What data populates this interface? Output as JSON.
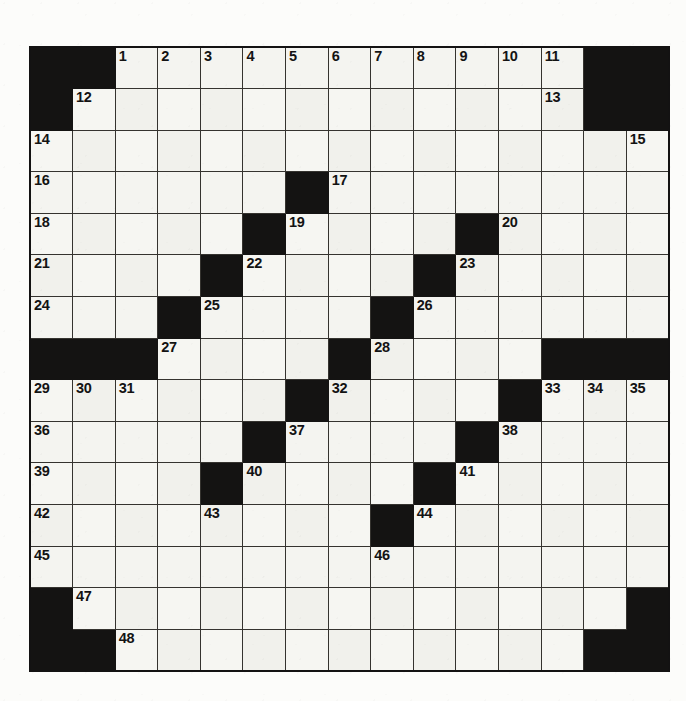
{
  "puzzle": {
    "title": "Crossword Grid",
    "type": "crossword-grid",
    "rows": 15,
    "cols": 15,
    "colors": {
      "block": "#141312",
      "cell": "#f4f4f0",
      "gridline": "#35332f",
      "border": "#131212",
      "number": "#131313",
      "paper": "#fcfcfa"
    },
    "legend": {
      "block_label": "blocked-square",
      "cell_label": "open-square"
    },
    "grid": [
      [
        {
          "block": true
        },
        {
          "block": true
        },
        {
          "num": "1"
        },
        {
          "num": "2"
        },
        {
          "num": "3"
        },
        {
          "num": "4"
        },
        {
          "num": "5"
        },
        {
          "num": "6"
        },
        {
          "num": "7"
        },
        {
          "num": "8"
        },
        {
          "num": "9"
        },
        {
          "num": "10"
        },
        {
          "num": "11"
        },
        {
          "block": true
        },
        {
          "block": true
        }
      ],
      [
        {
          "block": true
        },
        {
          "num": "12"
        },
        {},
        {},
        {},
        {},
        {},
        {},
        {},
        {},
        {},
        {},
        {
          "num": "13"
        },
        {
          "block": true
        },
        {
          "block": true
        }
      ],
      [
        {
          "num": "14"
        },
        {},
        {},
        {},
        {},
        {},
        {},
        {},
        {},
        {},
        {},
        {},
        {},
        {},
        {
          "num": "15"
        }
      ],
      [
        {
          "num": "16"
        },
        {},
        {},
        {},
        {},
        {},
        {
          "block": true
        },
        {
          "num": "17"
        },
        {},
        {},
        {},
        {},
        {},
        {},
        {}
      ],
      [
        {
          "num": "18"
        },
        {},
        {},
        {},
        {},
        {
          "block": true
        },
        {
          "num": "19"
        },
        {},
        {},
        {},
        {
          "block": true
        },
        {
          "num": "20"
        },
        {},
        {},
        {}
      ],
      [
        {
          "num": "21"
        },
        {},
        {},
        {},
        {
          "block": true
        },
        {
          "num": "22"
        },
        {},
        {},
        {},
        {
          "block": true
        },
        {
          "num": "23"
        },
        {},
        {},
        {},
        {}
      ],
      [
        {
          "num": "24"
        },
        {},
        {},
        {
          "block": true
        },
        {
          "num": "25"
        },
        {},
        {},
        {},
        {
          "block": true
        },
        {
          "num": "26"
        },
        {},
        {},
        {},
        {},
        {}
      ],
      [
        {
          "block": true
        },
        {
          "block": true
        },
        {
          "block": true
        },
        {
          "num": "27"
        },
        {},
        {},
        {},
        {
          "block": true
        },
        {
          "num": "28"
        },
        {},
        {},
        {},
        {
          "block": true
        },
        {
          "block": true
        },
        {
          "block": true
        }
      ],
      [
        {
          "num": "29"
        },
        {
          "num": "30"
        },
        {
          "num": "31"
        },
        {},
        {},
        {},
        {
          "block": true
        },
        {
          "num": "32"
        },
        {},
        {},
        {},
        {
          "block": true
        },
        {
          "num": "33"
        },
        {
          "num": "34"
        },
        {
          "num": "35"
        }
      ],
      [
        {
          "num": "36"
        },
        {},
        {},
        {},
        {},
        {
          "block": true
        },
        {
          "num": "37"
        },
        {},
        {},
        {},
        {
          "block": true
        },
        {
          "num": "38"
        },
        {},
        {},
        {}
      ],
      [
        {
          "num": "39"
        },
        {},
        {},
        {},
        {
          "block": true
        },
        {
          "num": "40"
        },
        {},
        {},
        {},
        {
          "block": true
        },
        {
          "num": "41"
        },
        {},
        {},
        {},
        {}
      ],
      [
        {
          "num": "42"
        },
        {},
        {},
        {},
        {
          "num": "43"
        },
        {},
        {},
        {},
        {
          "block": true
        },
        {
          "num": "44"
        },
        {},
        {},
        {},
        {},
        {}
      ],
      [
        {
          "num": "45"
        },
        {},
        {},
        {},
        {},
        {},
        {},
        {},
        {
          "num": "46"
        },
        {},
        {},
        {},
        {},
        {},
        {}
      ],
      [
        {
          "block": true
        },
        {
          "num": "47"
        },
        {},
        {},
        {},
        {},
        {},
        {},
        {},
        {},
        {},
        {},
        {},
        {},
        {
          "block": true
        }
      ],
      [
        {
          "block": true
        },
        {
          "block": true
        },
        {
          "num": "48"
        },
        {},
        {},
        {},
        {},
        {},
        {},
        {},
        {},
        {},
        {},
        {
          "block": true
        },
        {
          "block": true
        }
      ]
    ],
    "clue_numbers": [
      "1",
      "2",
      "3",
      "4",
      "5",
      "6",
      "7",
      "8",
      "9",
      "10",
      "11",
      "12",
      "13",
      "14",
      "15",
      "16",
      "17",
      "18",
      "19",
      "20",
      "21",
      "22",
      "23",
      "24",
      "25",
      "26",
      "27",
      "28",
      "29",
      "30",
      "31",
      "32",
      "33",
      "34",
      "35",
      "36",
      "37",
      "38",
      "39",
      "40",
      "41",
      "42",
      "43",
      "44",
      "45",
      "46",
      "47",
      "48"
    ]
  }
}
